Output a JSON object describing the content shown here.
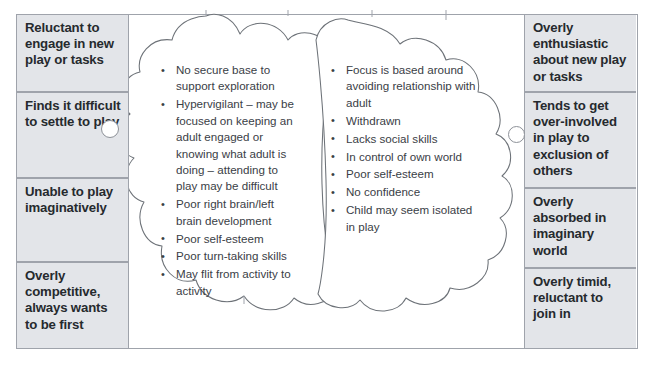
{
  "diagram": {
    "frame_border_color": "#9fa3ab",
    "box_fill_color": "#e3e5e9",
    "box_text_color": "#262a2e",
    "bullet_text_color": "#3a4046",
    "cloud_outline_color": "#6d7278"
  },
  "left_column": {
    "name": "left-behaviour-column",
    "boxes": [
      {
        "id": "reluctant-to-engage",
        "label": "Reluctant to engage in new play or tasks"
      },
      {
        "id": "finds-it-difficult",
        "label": "Finds it difficult to settle to play"
      },
      {
        "id": "unable-to-play",
        "label": "Unable to play imaginatively"
      },
      {
        "id": "overly-competitive",
        "label": "Overly competitive, always wants to be first"
      }
    ]
  },
  "right_column": {
    "name": "right-behaviour-column",
    "boxes": [
      {
        "id": "overly-enthusiastic",
        "label": "Overly enthusiastic about new play or tasks"
      },
      {
        "id": "tends-to-get-involved",
        "label": "Tends to get over-involved in play to exclusion of others"
      },
      {
        "id": "overly-absorbed",
        "label": "Overly absorbed in imaginary world"
      },
      {
        "id": "overly-timid",
        "label": "Overly timid, reluctant to join in"
      }
    ]
  },
  "left_cloud": {
    "name": "left-cloud",
    "bullets": [
      "No secure base to support exploration",
      "Hypervigilant – may be focused on keeping an adult engaged or knowing what adult is doing – attending to play may be difficult",
      "Poor right brain/left brain development",
      "Poor self-esteem",
      "Poor turn-taking skills",
      "May flit from activity to activity"
    ]
  },
  "right_cloud": {
    "name": "right-cloud",
    "bullets": [
      "Focus is based around avoiding relationship with adult",
      "Withdrawn",
      "Lacks social skills",
      "In control of own world",
      "Poor self-esteem",
      "No confidence",
      "Child may seem isolated in play"
    ]
  },
  "connectors": [
    {
      "id": "left-connector-knob",
      "shape": "circle"
    },
    {
      "id": "right-connector-knob",
      "shape": "circle"
    }
  ]
}
